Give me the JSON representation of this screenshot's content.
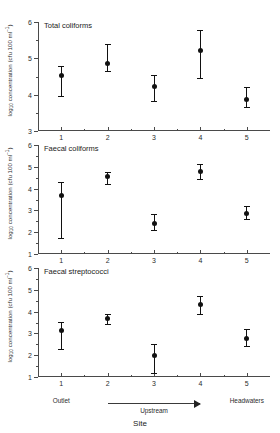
{
  "chart_data": {
    "type": "scatter",
    "title": "",
    "xlabel": "Site",
    "ylabel_parts": {
      "pre": "log",
      "sub": "10",
      "mid": " concentration (cfu 100 ml",
      "sup": "−1",
      "post": ")"
    },
    "ylabel": "log10 concentration (cfu 100 ml-1)",
    "x": [
      1,
      2,
      3,
      4,
      5
    ],
    "xtick_labels": [
      "1",
      "2",
      "3",
      "4",
      "5"
    ],
    "xlim": [
      0.5,
      5.5
    ],
    "grid": false,
    "legend": "none",
    "error_style": "mean with error bars (caps)",
    "panels": [
      {
        "name": "total-coliforms",
        "title": "Total coliforms",
        "ylim": [
          3,
          6
        ],
        "ytick_labels": [
          "3",
          "4",
          "5",
          "6"
        ],
        "yticks": [
          3,
          4,
          5,
          6
        ],
        "yminor": [
          3.5,
          4.5,
          5.5
        ],
        "values": [
          4.52,
          4.85,
          4.22,
          5.22,
          3.88
        ],
        "err_low": [
          3.95,
          4.65,
          3.82,
          4.45,
          3.65
        ],
        "err_high": [
          4.8,
          5.4,
          4.55,
          5.78,
          4.22
        ]
      },
      {
        "name": "faecal-coliforms",
        "title": "Faecal coliforms",
        "ylim": [
          1,
          6
        ],
        "ytick_labels": [
          "1",
          "2",
          "3",
          "4",
          "5",
          "6"
        ],
        "yticks": [
          1,
          2,
          3,
          4,
          5,
          6
        ],
        "yminor": [
          1.5,
          2.5,
          3.5,
          4.5,
          5.5
        ],
        "values": [
          3.7,
          4.55,
          2.42,
          4.8,
          2.88
        ],
        "err_low": [
          1.75,
          4.2,
          2.1,
          4.42,
          2.62
        ],
        "err_high": [
          4.3,
          4.78,
          2.85,
          5.15,
          3.2
        ]
      },
      {
        "name": "faecal-streptococci",
        "title": "Faecal streptococci",
        "ylim": [
          1,
          6
        ],
        "ytick_labels": [
          "1",
          "2",
          "3",
          "4",
          "5",
          "6"
        ],
        "yticks": [
          1,
          2,
          3,
          4,
          5,
          6
        ],
        "yminor": [
          1.5,
          2.5,
          3.5,
          4.5,
          5.5
        ],
        "values": [
          3.13,
          3.68,
          1.97,
          4.32,
          2.77
        ],
        "err_low": [
          2.28,
          3.45,
          1.18,
          3.9,
          2.4
        ],
        "err_high": [
          3.52,
          3.9,
          2.5,
          4.7,
          3.18
        ]
      }
    ],
    "annotations": {
      "outlet": "Outlet",
      "upstream": "Upstream",
      "headwaters": "Headwaters",
      "arrow_from_site": 2,
      "arrow_to_site": 4
    }
  }
}
